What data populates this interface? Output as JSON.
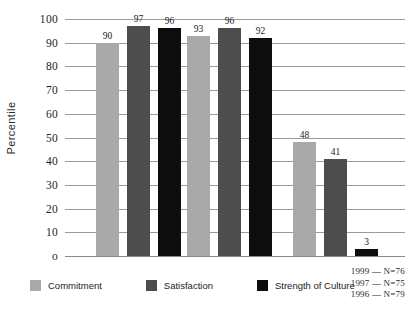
{
  "chart_data": {
    "type": "bar",
    "title": "",
    "xlabel": "",
    "ylabel": "Percentile",
    "ylim": [
      0,
      100
    ],
    "yticks": [
      0,
      10,
      20,
      30,
      40,
      50,
      60,
      70,
      80,
      90,
      100
    ],
    "ytick_labels": [
      "o",
      "10",
      "20",
      "30",
      "40",
      "50",
      "60",
      "70",
      "80",
      "90",
      "100"
    ],
    "grid": true,
    "legend_position": "bottom",
    "categories": [
      "Group 1",
      "Group 2",
      "Group 3"
    ],
    "series": [
      {
        "name": "Commitment",
        "color": "#a9a9a9",
        "values": [
          90,
          93,
          48
        ]
      },
      {
        "name": "Satisfaction",
        "color": "#4d4d4d",
        "values": [
          97,
          96,
          41
        ]
      },
      {
        "name": "Strength of Culture",
        "color": "#0d0d0d",
        "values": [
          96,
          92,
          3
        ]
      }
    ],
    "bars": [
      {
        "group": 0,
        "series": "Commitment",
        "value": 90,
        "label": "90",
        "color": "#a9a9a9"
      },
      {
        "group": 0,
        "series": "Satisfaction",
        "value": 97,
        "label": "97",
        "color": "#4d4d4d"
      },
      {
        "group": 0,
        "series": "Strength of Culture",
        "value": 96,
        "label": "96",
        "color": "#0d0d0d"
      },
      {
        "group": 1,
        "series": "Commitment",
        "value": 93,
        "label": "93",
        "color": "#a9a9a9"
      },
      {
        "group": 1,
        "series": "Satisfaction",
        "value": 96,
        "label": "96",
        "color": "#4d4d4d"
      },
      {
        "group": 1,
        "series": "Strength of Culture",
        "value": 92,
        "label": "92",
        "color": "#0d0d0d"
      },
      {
        "group": 2,
        "series": "Commitment",
        "value": 48,
        "label": "48",
        "color": "#a9a9a9"
      },
      {
        "group": 2,
        "series": "Satisfaction",
        "value": 41,
        "label": "41",
        "color": "#4d4d4d"
      },
      {
        "group": 2,
        "series": "Strength of Culture",
        "value": 3,
        "label": "3",
        "color": "#0d0d0d"
      }
    ],
    "annotations": [
      "1999 — N=76",
      "1997 — N=75",
      "1996 — N=79"
    ]
  },
  "legend": {
    "items": [
      {
        "label": "Commitment",
        "color": "#a9a9a9"
      },
      {
        "label": "Satisfaction",
        "color": "#4d4d4d"
      },
      {
        "label": "Strength of Culture",
        "color": "#0d0d0d"
      }
    ]
  },
  "axis": {
    "y_title": "Percentile"
  },
  "notes": {
    "lines": [
      "1999 — N=76",
      "1997 — N=75",
      "1996 — N=79"
    ]
  }
}
